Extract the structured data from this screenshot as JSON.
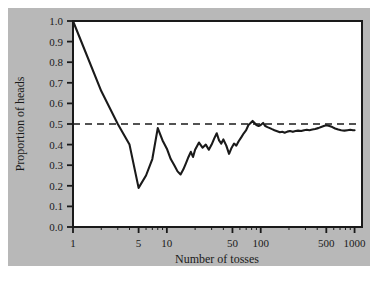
{
  "figure": {
    "background_color": "#ffffff",
    "plate_color": "#b8b8b8",
    "plot_area_color": "#ffffff",
    "frame_color": "#1a1a1a",
    "line_color": "#1a1a1a",
    "reference_line_color": "#1a1a1a"
  },
  "chart_data": {
    "type": "line",
    "title": "",
    "subtitle": "",
    "xlabel": "Number of tosses",
    "ylabel": "Proportion of heads",
    "xscale": "log",
    "yscale": "linear",
    "xlim": [
      1,
      1200
    ],
    "ylim": [
      0.0,
      1.0
    ],
    "grid": false,
    "legend": false,
    "legend_position": "none",
    "xticks": [
      1,
      5,
      10,
      50,
      100,
      500,
      1000
    ],
    "xtick_labels": [
      "1",
      "5",
      "10",
      "50",
      "100",
      "500",
      "1000"
    ],
    "yticks": [
      0.0,
      0.1,
      0.2,
      0.3,
      0.4,
      0.5,
      0.6,
      0.7,
      0.8,
      0.9,
      1.0
    ],
    "ytick_labels": [
      "0.0",
      "0.1",
      "0.2",
      "0.3",
      "0.4",
      "0.5",
      "0.6",
      "0.7",
      "0.8",
      "0.9",
      "1.0"
    ],
    "annotations": [
      {
        "type": "hline",
        "value": 0.5,
        "style": "dashed",
        "label": "0.5 expected proportion"
      }
    ],
    "series": [
      {
        "name": "Proportion of heads",
        "x": [
          1,
          2,
          3,
          4,
          5,
          6,
          7,
          8,
          9,
          10,
          11,
          12,
          13,
          14,
          15,
          16,
          17,
          18,
          19,
          20,
          22,
          24,
          26,
          28,
          30,
          32,
          34,
          36,
          38,
          40,
          43,
          46,
          49,
          52,
          55,
          58,
          62,
          66,
          70,
          74,
          78,
          82,
          86,
          90,
          95,
          100,
          106,
          112,
          118,
          125,
          132,
          140,
          150,
          160,
          170,
          180,
          192,
          205,
          220,
          235,
          250,
          270,
          290,
          310,
          330,
          355,
          380,
          410,
          440,
          470,
          500,
          540,
          580,
          620,
          670,
          720,
          780,
          840,
          900,
          960,
          1000
        ],
        "y": [
          1.0,
          0.66,
          0.5,
          0.4,
          0.19,
          0.25,
          0.33,
          0.48,
          0.42,
          0.38,
          0.33,
          0.3,
          0.27,
          0.255,
          0.28,
          0.31,
          0.34,
          0.365,
          0.34,
          0.375,
          0.41,
          0.385,
          0.4,
          0.375,
          0.4,
          0.43,
          0.455,
          0.42,
          0.405,
          0.425,
          0.395,
          0.355,
          0.385,
          0.405,
          0.395,
          0.415,
          0.435,
          0.455,
          0.47,
          0.495,
          0.505,
          0.515,
          0.505,
          0.495,
          0.49,
          0.495,
          0.505,
          0.49,
          0.485,
          0.48,
          0.475,
          0.47,
          0.465,
          0.46,
          0.462,
          0.458,
          0.463,
          0.466,
          0.462,
          0.466,
          0.468,
          0.466,
          0.47,
          0.472,
          0.47,
          0.473,
          0.476,
          0.48,
          0.485,
          0.49,
          0.494,
          0.49,
          0.485,
          0.478,
          0.473,
          0.47,
          0.468,
          0.47,
          0.472,
          0.47,
          0.47
        ]
      }
    ]
  }
}
